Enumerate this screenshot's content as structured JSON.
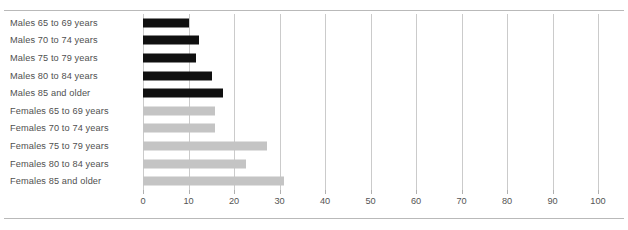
{
  "figure": {
    "has_top_rule": true,
    "has_bottom_rule": true,
    "rule_color": "#b9b9b9"
  },
  "colors": {
    "male_bar": "#101010",
    "female_bar": "#c4c4c4",
    "gridline": "#cbcbcb",
    "text": "#4f4f4f",
    "background": "#ffffff"
  },
  "chart_data": {
    "type": "bar",
    "orientation": "horizontal",
    "title": "",
    "xlabel": "",
    "ylabel": "",
    "xlim": [
      0,
      100
    ],
    "ylim": null,
    "grid": true,
    "grid_axis": "x",
    "legend": null,
    "xticks": [
      0,
      10,
      20,
      30,
      40,
      50,
      60,
      70,
      80,
      90,
      100
    ],
    "xtick_labels": [
      "0",
      "10",
      "20",
      "30",
      "40",
      "50",
      "60",
      "70",
      "80",
      "90",
      "100"
    ],
    "categories": [
      "Males 65 to 69 years",
      "Males 70 to 74 years",
      "Males 75 to 79 years",
      "Males 80 to 84 years",
      "Males 85 and older",
      "Females 65 to 69 years",
      "Females 70 to 74 years",
      "Females 75 to 79 years",
      "Females 80 to 84 years",
      "Females 85 and older"
    ],
    "values": [
      10.0,
      12.3,
      11.6,
      15.2,
      17.5,
      15.8,
      15.8,
      27.3,
      22.6,
      31.0
    ],
    "bar_colors": [
      "#101010",
      "#101010",
      "#101010",
      "#101010",
      "#101010",
      "#c4c4c4",
      "#c4c4c4",
      "#c4c4c4",
      "#c4c4c4",
      "#c4c4c4"
    ],
    "groups": [
      {
        "name": "Males",
        "color": "#101010"
      },
      {
        "name": "Females",
        "color": "#c4c4c4"
      }
    ]
  }
}
